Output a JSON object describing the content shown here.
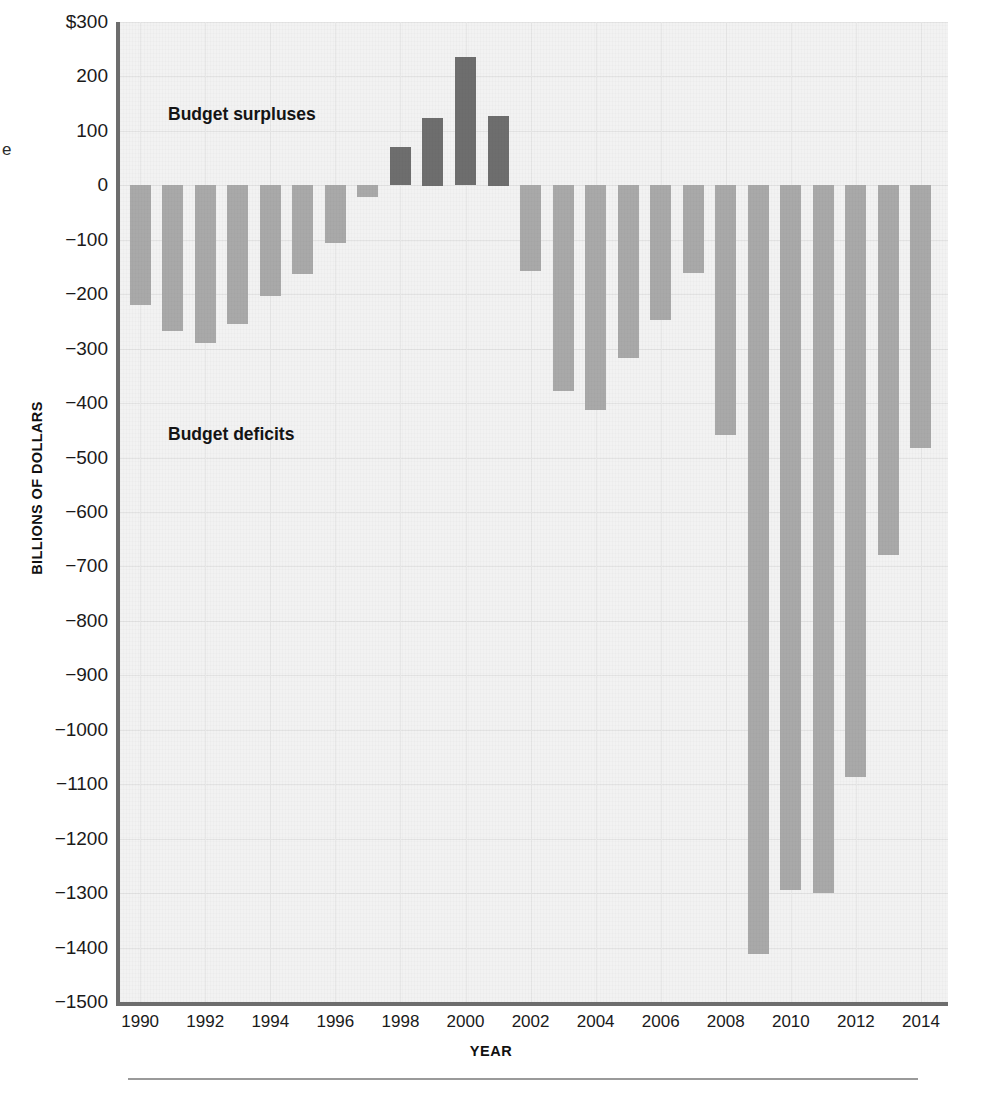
{
  "figure": {
    "stray_glyph": "e",
    "annotations": [
      {
        "id": "surplus-label",
        "text": "Budget surpluses",
        "x": 168,
        "y": 104
      },
      {
        "id": "deficit-label",
        "text": "Budget deficits",
        "x": 168,
        "y": 424
      }
    ]
  },
  "chart_data": {
    "type": "bar",
    "title": "",
    "xlabel": "YEAR",
    "ylabel": "BILLIONS OF DOLLARS",
    "ylim": [
      -1500,
      300
    ],
    "grid": true,
    "legend_position": "none",
    "y_ticks": [
      {
        "value": 300,
        "label": "$300"
      },
      {
        "value": 200,
        "label": "200"
      },
      {
        "value": 100,
        "label": "100"
      },
      {
        "value": 0,
        "label": "0"
      },
      {
        "value": -100,
        "label": "−100"
      },
      {
        "value": -200,
        "label": "−200"
      },
      {
        "value": -300,
        "label": "−300"
      },
      {
        "value": -400,
        "label": "−400"
      },
      {
        "value": -500,
        "label": "−500"
      },
      {
        "value": -600,
        "label": "−600"
      },
      {
        "value": -700,
        "label": "−700"
      },
      {
        "value": -800,
        "label": "−800"
      },
      {
        "value": -900,
        "label": "−900"
      },
      {
        "value": -1000,
        "label": "−1000"
      },
      {
        "value": -1100,
        "label": "−1100"
      },
      {
        "value": -1200,
        "label": "−1200"
      },
      {
        "value": -1300,
        "label": "−1300"
      },
      {
        "value": -1400,
        "label": "−1400"
      },
      {
        "value": -1500,
        "label": "−1500"
      }
    ],
    "x_tick_labels": [
      "1990",
      "1992",
      "1994",
      "1996",
      "1998",
      "2000",
      "2002",
      "2004",
      "2006",
      "2008",
      "2010",
      "2012",
      "2014"
    ],
    "categories": [
      1990,
      1991,
      1992,
      1993,
      1994,
      1995,
      1996,
      1997,
      1998,
      1999,
      2000,
      2001,
      2002,
      2003,
      2004,
      2005,
      2006,
      2007,
      2008,
      2009,
      2010,
      2011,
      2012,
      2013,
      2014
    ],
    "values": [
      -221,
      -269,
      -290,
      -255,
      -203,
      -164,
      -107,
      -22,
      70,
      124,
      236,
      128,
      -158,
      -378,
      -413,
      -318,
      -248,
      -161,
      -459,
      -1413,
      -1294,
      -1300,
      -1087,
      -680,
      -483
    ],
    "series": [
      {
        "name": "Federal budget surplus or deficit",
        "values": [
          -221,
          -269,
          -290,
          -255,
          -203,
          -164,
          -107,
          -22,
          70,
          124,
          236,
          128,
          -158,
          -378,
          -413,
          -318,
          -248,
          -161,
          -459,
          -1413,
          -1294,
          -1300,
          -1087,
          -680,
          -483
        ]
      }
    ],
    "colors": {
      "deficit": "#a9a9a9",
      "surplus": "#6e6e6e",
      "panel": "#f2f2f2",
      "axis": "#6d6d6d",
      "gridline": "#e3e3e3"
    }
  }
}
